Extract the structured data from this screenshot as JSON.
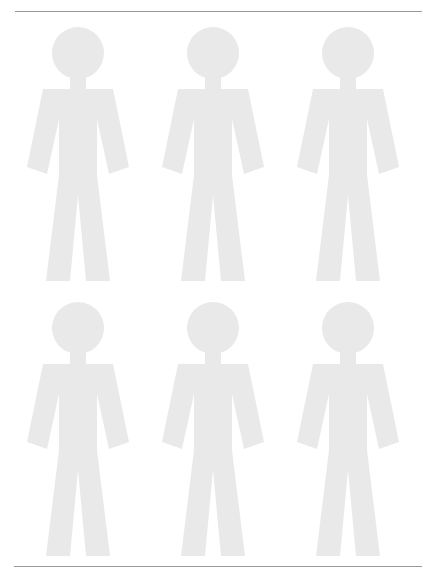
{
  "page": {
    "width": 437,
    "height": 579,
    "background_color": "#ffffff"
  },
  "rules": {
    "color": "#9a9a9a",
    "top": {
      "label": "top horizontal rule",
      "x": 15,
      "y": 11,
      "width": 407
    },
    "bottom": {
      "label": "bottom horizontal rule",
      "x": 14,
      "y": 566,
      "width": 408
    }
  },
  "figures": {
    "icon_name": "person-pictogram-icon",
    "fill_color": "#e9e9e9",
    "count": 6,
    "rows": 2,
    "columns": 3,
    "width": 118,
    "height": 256,
    "items": [
      {
        "label": "person 1",
        "row": 1,
        "column": 1,
        "x": 19,
        "y": 27
      },
      {
        "label": "person 2",
        "row": 1,
        "column": 2,
        "x": 154,
        "y": 27
      },
      {
        "label": "person 3",
        "row": 1,
        "column": 3,
        "x": 289,
        "y": 27
      },
      {
        "label": "person 4",
        "row": 2,
        "column": 1,
        "x": 19,
        "y": 302
      },
      {
        "label": "person 5",
        "row": 2,
        "column": 2,
        "x": 154,
        "y": 302
      },
      {
        "label": "person 6",
        "row": 2,
        "column": 3,
        "x": 289,
        "y": 302
      }
    ]
  }
}
